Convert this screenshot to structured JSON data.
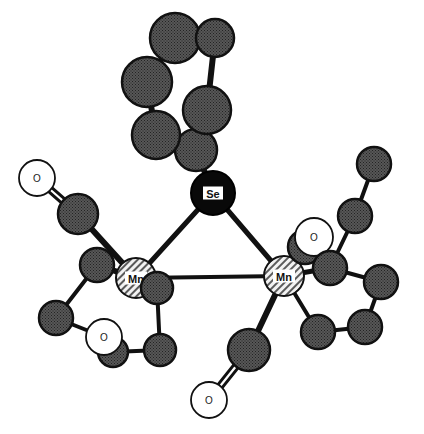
{
  "figure": {
    "type": "ball-and-stick-crystal-structure",
    "background_color": "#ffffff",
    "bond_color": "#111111"
  },
  "legend": {
    "metal_label": "Mn",
    "selenium_label": "Se",
    "oxygen_label": "O"
  },
  "palette": {
    "carbon_fill": "#4a4a4a",
    "carbon_stroke": "#111111",
    "selenium_fill": "#0a0a0a",
    "selenium_stroke": "#000000",
    "manganese_fill": "#e8e8e8",
    "manganese_stroke": "#111111",
    "oxygen_fill": "#ffffff",
    "oxygen_stroke": "#111111"
  },
  "atoms": [
    {
      "id": "se1",
      "element": "Se",
      "label": "Se",
      "style": "selenium",
      "cx": 213,
      "cy": 193,
      "r": 22
    },
    {
      "id": "mn1",
      "element": "Mn",
      "label": "Mn",
      "style": "manganese",
      "cx": 136,
      "cy": 278,
      "r": 20
    },
    {
      "id": "mn2",
      "element": "Mn",
      "label": "Mn",
      "style": "manganese",
      "cx": 284,
      "cy": 276,
      "r": 20
    },
    {
      "id": "ar1",
      "element": "C",
      "label": "",
      "style": "carbon",
      "cx": 196,
      "cy": 150,
      "r": 21
    },
    {
      "id": "ar2",
      "element": "C",
      "label": "",
      "style": "carbon",
      "cx": 156,
      "cy": 135,
      "r": 24
    },
    {
      "id": "ar3",
      "element": "C",
      "label": "",
      "style": "carbon",
      "cx": 207,
      "cy": 110,
      "r": 24
    },
    {
      "id": "ar4",
      "element": "C",
      "label": "",
      "style": "carbon",
      "cx": 147,
      "cy": 82,
      "r": 25
    },
    {
      "id": "ar5",
      "element": "C",
      "label": "",
      "style": "carbon",
      "cx": 175,
      "cy": 38,
      "r": 25
    },
    {
      "id": "ar6",
      "element": "C",
      "label": "",
      "style": "carbon",
      "cx": 215,
      "cy": 38,
      "r": 19
    },
    {
      "id": "lc1",
      "element": "C",
      "label": "",
      "style": "carbon",
      "cx": 78,
      "cy": 214,
      "r": 20
    },
    {
      "id": "lo1",
      "element": "O",
      "label": "O",
      "style": "oxygen",
      "cx": 37,
      "cy": 178,
      "r": 18
    },
    {
      "id": "lc2",
      "element": "C",
      "label": "",
      "style": "carbon",
      "cx": 97,
      "cy": 265,
      "r": 17
    },
    {
      "id": "lc3",
      "element": "C",
      "label": "",
      "style": "carbon",
      "cx": 56,
      "cy": 318,
      "r": 17
    },
    {
      "id": "lc4",
      "element": "C",
      "label": "",
      "style": "carbon",
      "cx": 113,
      "cy": 352,
      "r": 15
    },
    {
      "id": "lc5",
      "element": "C",
      "label": "",
      "style": "carbon",
      "cx": 160,
      "cy": 350,
      "r": 16
    },
    {
      "id": "lc6",
      "element": "C",
      "label": "",
      "style": "carbon",
      "cx": 157,
      "cy": 288,
      "r": 16
    },
    {
      "id": "lo2",
      "element": "O",
      "label": "O",
      "style": "oxygen",
      "cx": 104,
      "cy": 337,
      "r": 18
    },
    {
      "id": "rc1",
      "element": "C",
      "label": "",
      "style": "carbon",
      "cx": 305,
      "cy": 247,
      "r": 17
    },
    {
      "id": "ro1",
      "element": "O",
      "label": "O",
      "style": "oxygen",
      "cx": 314,
      "cy": 237,
      "r": 19
    },
    {
      "id": "rc2",
      "element": "C",
      "label": "",
      "style": "carbon",
      "cx": 330,
      "cy": 268,
      "r": 17
    },
    {
      "id": "rc3",
      "element": "C",
      "label": "",
      "style": "carbon",
      "cx": 355,
      "cy": 216,
      "r": 17
    },
    {
      "id": "rc4",
      "element": "C",
      "label": "",
      "style": "carbon",
      "cx": 374,
      "cy": 164,
      "r": 17
    },
    {
      "id": "rc5",
      "element": "C",
      "label": "",
      "style": "carbon",
      "cx": 381,
      "cy": 282,
      "r": 17
    },
    {
      "id": "rc6",
      "element": "C",
      "label": "",
      "style": "carbon",
      "cx": 365,
      "cy": 327,
      "r": 17
    },
    {
      "id": "rc7",
      "element": "C",
      "label": "",
      "style": "carbon",
      "cx": 318,
      "cy": 332,
      "r": 17
    },
    {
      "id": "bc1",
      "element": "C",
      "label": "",
      "style": "carbon",
      "cx": 249,
      "cy": 350,
      "r": 21
    },
    {
      "id": "bo1",
      "element": "O",
      "label": "O",
      "style": "oxygen",
      "cx": 209,
      "cy": 400,
      "r": 18
    }
  ],
  "bonds": [
    {
      "from": "se1",
      "to": "mn1",
      "order": 1,
      "width": 5
    },
    {
      "from": "se1",
      "to": "mn2",
      "order": 1,
      "width": 5
    },
    {
      "from": "mn1",
      "to": "mn2",
      "order": 1,
      "width": 4
    },
    {
      "from": "se1",
      "to": "ar1",
      "order": 1,
      "width": 6
    },
    {
      "from": "ar1",
      "to": "ar2",
      "order": 1,
      "width": 6
    },
    {
      "from": "ar1",
      "to": "ar3",
      "order": 1,
      "width": 6
    },
    {
      "from": "ar2",
      "to": "ar4",
      "order": 1,
      "width": 6
    },
    {
      "from": "ar3",
      "to": "ar6",
      "order": 1,
      "width": 6
    },
    {
      "from": "ar4",
      "to": "ar5",
      "order": 1,
      "width": 6
    },
    {
      "from": "ar5",
      "to": "ar6",
      "order": 1,
      "width": 6
    },
    {
      "from": "mn1",
      "to": "lc1",
      "order": 1,
      "width": 6
    },
    {
      "from": "lc1",
      "to": "lo1",
      "order": 2,
      "width": 3
    },
    {
      "from": "mn1",
      "to": "lc2",
      "order": 1,
      "width": 6
    },
    {
      "from": "lc2",
      "to": "lc3",
      "order": 1,
      "width": 4
    },
    {
      "from": "lc3",
      "to": "lo2",
      "order": 1,
      "width": 4
    },
    {
      "from": "lo2",
      "to": "lc4",
      "order": 1,
      "width": 4
    },
    {
      "from": "lc4",
      "to": "lc5",
      "order": 1,
      "width": 4
    },
    {
      "from": "lc5",
      "to": "lc6",
      "order": 1,
      "width": 4
    },
    {
      "from": "lc6",
      "to": "mn1",
      "order": 1,
      "width": 4
    },
    {
      "from": "mn2",
      "to": "rc1",
      "order": 1,
      "width": 6
    },
    {
      "from": "rc1",
      "to": "ro1",
      "order": 2,
      "width": 3
    },
    {
      "from": "mn2",
      "to": "rc2",
      "order": 1,
      "width": 5
    },
    {
      "from": "rc2",
      "to": "rc3",
      "order": 1,
      "width": 4
    },
    {
      "from": "rc3",
      "to": "rc4",
      "order": 1,
      "width": 4
    },
    {
      "from": "rc2",
      "to": "rc5",
      "order": 1,
      "width": 4
    },
    {
      "from": "rc5",
      "to": "rc6",
      "order": 1,
      "width": 4
    },
    {
      "from": "rc6",
      "to": "rc7",
      "order": 1,
      "width": 4
    },
    {
      "from": "rc7",
      "to": "mn2",
      "order": 1,
      "width": 4
    },
    {
      "from": "mn2",
      "to": "bc1",
      "order": 1,
      "width": 6
    },
    {
      "from": "bc1",
      "to": "bo1",
      "order": 2,
      "width": 3
    }
  ]
}
